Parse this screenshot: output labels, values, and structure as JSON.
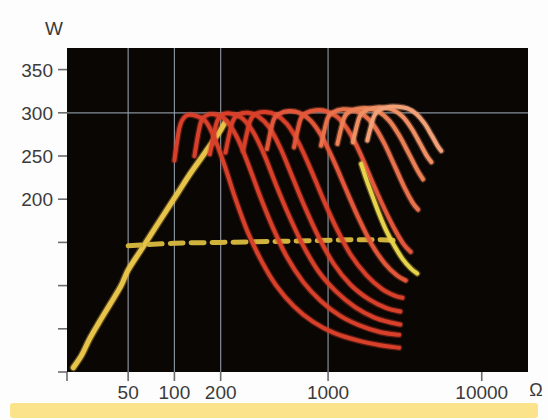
{
  "figure": {
    "background_color": "#ffffff",
    "plot_background_color": "#0a0604",
    "grid_color": "#9aa7b5",
    "axis_text_color": "#3b3b3b"
  },
  "banner": {
    "name": "caption-banner",
    "color": "#fbe38c"
  },
  "chart_data": {
    "type": "line",
    "title": "",
    "subtitle": "",
    "xlabel": "Ω",
    "ylabel": "W",
    "xscale": "log",
    "yscale": "linear",
    "xlim": [
      20,
      20000
    ],
    "ylim": [
      0,
      375
    ],
    "grid": true,
    "grid_x_values": [
      50,
      100,
      200,
      1000
    ],
    "grid_y_values": [
      300
    ],
    "legend_position": "none",
    "annotations": [],
    "x_ticks": [
      {
        "value": 50,
        "label": "50"
      },
      {
        "value": 100,
        "label": "100"
      },
      {
        "value": 200,
        "label": "200"
      },
      {
        "value": 1000,
        "label": "1000"
      },
      {
        "value": 10000,
        "label": "10000"
      }
    ],
    "y_ticks": [
      {
        "value": 350,
        "label": "350"
      },
      {
        "value": 300,
        "label": "300"
      },
      {
        "value": 250,
        "label": "250"
      },
      {
        "value": 200,
        "label": "200"
      },
      {
        "value": 150,
        "label": ""
      },
      {
        "value": 100,
        "label": ""
      },
      {
        "value": 50,
        "label": ""
      },
      {
        "value": 0,
        "label": ""
      }
    ],
    "y_tick_labels_shown": [
      "350",
      "300",
      "250",
      "200",
      "100"
    ],
    "series": [
      {
        "name": "rising-yellow-curve",
        "color": "#e8c349",
        "style": "solid",
        "width": 5,
        "points": [
          [
            22,
            5
          ],
          [
            25,
            20
          ],
          [
            28,
            38
          ],
          [
            32,
            56
          ],
          [
            38,
            78
          ],
          [
            45,
            100
          ],
          [
            50,
            118
          ],
          [
            60,
            140
          ],
          [
            72,
            162
          ],
          [
            88,
            186
          ],
          [
            105,
            207
          ],
          [
            125,
            228
          ],
          [
            150,
            248
          ],
          [
            175,
            265
          ],
          [
            200,
            280
          ],
          [
            215,
            290
          ]
        ]
      },
      {
        "name": "dashed-limit-line",
        "color": "#d0b33c",
        "style": "dashed",
        "width": 5,
        "points": [
          [
            50,
            146
          ],
          [
            100,
            149
          ],
          [
            200,
            150
          ],
          [
            400,
            151
          ],
          [
            800,
            152
          ],
          [
            1400,
            153
          ],
          [
            2200,
            153
          ],
          [
            2900,
            152
          ]
        ]
      },
      {
        "name": "power-curve-1",
        "color": "#d8402a",
        "style": "solid",
        "width": 4,
        "peak_w": 297,
        "points": [
          [
            100,
            245
          ],
          [
            108,
            283
          ],
          [
            118,
            296
          ],
          [
            135,
            297
          ],
          [
            160,
            290
          ],
          [
            185,
            268
          ],
          [
            215,
            236
          ],
          [
            250,
            200
          ],
          [
            300,
            162
          ],
          [
            370,
            128
          ],
          [
            460,
            100
          ],
          [
            600,
            76
          ],
          [
            800,
            58
          ],
          [
            1100,
            45
          ],
          [
            1600,
            36
          ],
          [
            2200,
            31
          ],
          [
            2900,
            28
          ]
        ]
      },
      {
        "name": "power-curve-2",
        "color": "#d8402a",
        "style": "solid",
        "width": 4,
        "peak_w": 297,
        "points": [
          [
            135,
            250
          ],
          [
            148,
            288
          ],
          [
            162,
            297
          ],
          [
            185,
            298
          ],
          [
            215,
            292
          ],
          [
            255,
            272
          ],
          [
            300,
            242
          ],
          [
            360,
            204
          ],
          [
            440,
            166
          ],
          [
            540,
            133
          ],
          [
            690,
            104
          ],
          [
            900,
            82
          ],
          [
            1200,
            65
          ],
          [
            1600,
            54
          ],
          [
            2200,
            46
          ],
          [
            2900,
            43
          ]
        ]
      },
      {
        "name": "power-curve-3",
        "color": "#d8402a",
        "style": "solid",
        "width": 4,
        "peak_w": 298,
        "points": [
          [
            170,
            252
          ],
          [
            188,
            288
          ],
          [
            205,
            298
          ],
          [
            235,
            299
          ],
          [
            275,
            294
          ],
          [
            325,
            278
          ],
          [
            385,
            251
          ],
          [
            460,
            216
          ],
          [
            560,
            180
          ],
          [
            690,
            146
          ],
          [
            870,
            116
          ],
          [
            1130,
            93
          ],
          [
            1500,
            75
          ],
          [
            2000,
            63
          ],
          [
            2600,
            57
          ],
          [
            2950,
            55
          ]
        ]
      },
      {
        "name": "power-curve-4",
        "color": "#d8402a",
        "style": "solid",
        "width": 4,
        "peak_w": 299,
        "points": [
          [
            215,
            254
          ],
          [
            238,
            289
          ],
          [
            262,
            298
          ],
          [
            300,
            300
          ],
          [
            350,
            296
          ],
          [
            415,
            283
          ],
          [
            490,
            259
          ],
          [
            585,
            226
          ],
          [
            710,
            190
          ],
          [
            870,
            156
          ],
          [
            1090,
            125
          ],
          [
            1400,
            101
          ],
          [
            1850,
            84
          ],
          [
            2400,
            74
          ],
          [
            2950,
            70
          ]
        ]
      },
      {
        "name": "power-curve-5",
        "color": "#d8402a",
        "style": "solid",
        "width": 4,
        "peak_w": 299,
        "points": [
          [
            280,
            256
          ],
          [
            310,
            290
          ],
          [
            340,
            299
          ],
          [
            390,
            301
          ],
          [
            455,
            298
          ],
          [
            540,
            287
          ],
          [
            640,
            266
          ],
          [
            765,
            236
          ],
          [
            925,
            201
          ],
          [
            1130,
            167
          ],
          [
            1400,
            136
          ],
          [
            1780,
            112
          ],
          [
            2250,
            96
          ],
          [
            2750,
            88
          ],
          [
            3050,
            86
          ]
        ]
      },
      {
        "name": "power-curve-6",
        "color": "#e2573a",
        "style": "solid",
        "width": 4,
        "peak_w": 300,
        "points": [
          [
            400,
            258
          ],
          [
            440,
            291
          ],
          [
            485,
            299
          ],
          [
            555,
            302
          ],
          [
            650,
            300
          ],
          [
            770,
            291
          ],
          [
            915,
            272
          ],
          [
            1090,
            244
          ],
          [
            1310,
            211
          ],
          [
            1580,
            178
          ],
          [
            1920,
            148
          ],
          [
            2330,
            126
          ],
          [
            2800,
            112
          ],
          [
            3200,
            106
          ]
        ]
      },
      {
        "name": "power-curve-7",
        "color": "#e2573a",
        "style": "solid",
        "width": 4,
        "peak_w": 301,
        "points": [
          [
            600,
            260
          ],
          [
            660,
            292
          ],
          [
            725,
            300
          ],
          [
            830,
            303
          ],
          [
            970,
            302
          ],
          [
            1150,
            295
          ],
          [
            1360,
            279
          ],
          [
            1610,
            254
          ],
          [
            1910,
            223
          ],
          [
            2270,
            193
          ],
          [
            2680,
            167
          ],
          [
            3100,
            148
          ],
          [
            3450,
            139
          ]
        ]
      },
      {
        "name": "power-curve-8",
        "color": "#e9714b",
        "style": "solid",
        "width": 4,
        "peak_w": 302,
        "points": [
          [
            900,
            262
          ],
          [
            990,
            293
          ],
          [
            1090,
            301
          ],
          [
            1250,
            304
          ],
          [
            1450,
            303
          ],
          [
            1700,
            298
          ],
          [
            1990,
            285
          ],
          [
            2330,
            264
          ],
          [
            2720,
            238
          ],
          [
            3150,
            213
          ],
          [
            3550,
            196
          ],
          [
            3850,
            188
          ]
        ]
      },
      {
        "name": "power-curve-9",
        "color": "#ec8055",
        "style": "solid",
        "width": 4,
        "peak_w": 303,
        "points": [
          [
            1150,
            264
          ],
          [
            1270,
            294
          ],
          [
            1400,
            302
          ],
          [
            1600,
            305
          ],
          [
            1850,
            305
          ],
          [
            2150,
            301
          ],
          [
            2500,
            291
          ],
          [
            2900,
            274
          ],
          [
            3350,
            253
          ],
          [
            3800,
            234
          ],
          [
            4150,
            223
          ]
        ]
      },
      {
        "name": "power-curve-10",
        "color": "#ef8f63",
        "style": "solid",
        "width": 4,
        "peak_w": 304,
        "points": [
          [
            1450,
            266
          ],
          [
            1600,
            295
          ],
          [
            1770,
            303
          ],
          [
            2020,
            306
          ],
          [
            2320,
            306
          ],
          [
            2680,
            303
          ],
          [
            3080,
            295
          ],
          [
            3520,
            281
          ],
          [
            3980,
            264
          ],
          [
            4400,
            250
          ],
          [
            4700,
            243
          ]
        ]
      },
      {
        "name": "power-curve-11",
        "color": "#f2a078",
        "style": "solid",
        "width": 4,
        "peak_w": 305,
        "points": [
          [
            1800,
            268
          ],
          [
            1990,
            296
          ],
          [
            2200,
            304
          ],
          [
            2500,
            307
          ],
          [
            2860,
            307
          ],
          [
            3280,
            305
          ],
          [
            3740,
            299
          ],
          [
            4230,
            288
          ],
          [
            4720,
            274
          ],
          [
            5150,
            262
          ],
          [
            5450,
            256
          ]
        ]
      },
      {
        "name": "upper-yellow-descending-curve",
        "color": "#e8d44a",
        "style": "solid",
        "width": 4,
        "points": [
          [
            1640,
            241
          ],
          [
            1780,
            222
          ],
          [
            1950,
            203
          ],
          [
            2150,
            183
          ],
          [
            2400,
            163
          ],
          [
            2700,
            146
          ],
          [
            3050,
            131
          ],
          [
            3450,
            120
          ],
          [
            3800,
            114
          ]
        ]
      }
    ]
  },
  "axes": {
    "y_axis_unit_label": "W",
    "x_axis_unit_label": "Ω"
  }
}
